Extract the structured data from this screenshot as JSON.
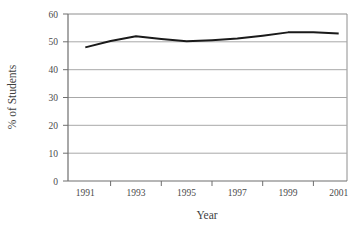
{
  "chart_data": {
    "type": "line",
    "title": "",
    "subtitle": "",
    "xlabel": "Year",
    "ylabel": "% of Students",
    "x": [
      1991,
      1992,
      1993,
      1994,
      1995,
      1996,
      1997,
      1998,
      1999,
      2000,
      2001
    ],
    "values": [
      48.0,
      50.3,
      52.0,
      51.0,
      50.2,
      50.6,
      51.2,
      52.2,
      53.4,
      53.4,
      53.0
    ],
    "series": [
      {
        "name": "% of Students",
        "values": [
          48.0,
          50.3,
          52.0,
          51.0,
          50.2,
          50.6,
          51.2,
          52.2,
          53.4,
          53.4,
          53.0
        ]
      }
    ],
    "xlim": [
      1990.5,
      2001.5
    ],
    "ylim": [
      0,
      60
    ],
    "ytick_labels": [
      "0",
      "10",
      "20",
      "30",
      "40",
      "50",
      "60"
    ],
    "yticks": [
      0,
      10,
      20,
      30,
      40,
      50,
      60
    ],
    "xtick_labels": [
      "1991",
      "1993",
      "1995",
      "1997",
      "1999",
      "2001"
    ],
    "xticks": [
      1991,
      1993,
      1995,
      1997,
      1999,
      2001
    ],
    "grid": "horizontal",
    "legend": "none",
    "line_color": "#1a1a1a",
    "grid_color": "#a8a8a8",
    "axis_color": "#6e6e6e",
    "background_color": "#ffffff"
  },
  "axes": {
    "x_title": "Year",
    "y_title": "% of Students"
  },
  "ticks": {
    "y": [
      "60",
      "50",
      "40",
      "30",
      "20",
      "10",
      "0"
    ],
    "x": [
      "1991",
      "1993",
      "1995",
      "1997",
      "1999",
      "2001"
    ]
  }
}
